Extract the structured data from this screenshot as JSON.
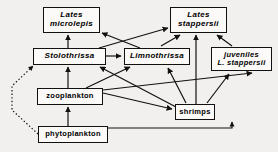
{
  "figure": {
    "type": "food-web-diagram",
    "width": 278,
    "height": 152,
    "background_color": "#f2f0ee",
    "box_fill_color": "#fbfaf8",
    "line_color": "#111111"
  },
  "nodes": [
    {
      "id": "lates-microlepis",
      "label_lines": [
        "Lates",
        "microlepis"
      ],
      "line1": "Lates",
      "line2": "microlepis",
      "style": "italic",
      "x": 43,
      "y": 7,
      "w": 57,
      "h": 26,
      "font_size": 8
    },
    {
      "id": "lates-stappersii",
      "label_lines": [
        "Lates",
        "stappersii"
      ],
      "line1": "Lates",
      "line2": "stappersii",
      "style": "italic",
      "x": 170,
      "y": 7,
      "w": 57,
      "h": 26,
      "font_size": 8
    },
    {
      "id": "stolothrissa",
      "label_lines": [
        "Stolothrissa"
      ],
      "line1": "Stolothrissa",
      "line2": "",
      "style": "italic",
      "x": 33,
      "y": 48,
      "w": 73,
      "h": 17,
      "font_size": 8
    },
    {
      "id": "limnothrissa",
      "label_lines": [
        "Limnothrissa"
      ],
      "line1": "Limnothrissa",
      "line2": "",
      "style": "italic",
      "x": 124,
      "y": 48,
      "w": 66,
      "h": 17,
      "font_size": 8
    },
    {
      "id": "juveniles-l-stappersii",
      "label_lines": [
        "juveniles",
        "L. stappersii"
      ],
      "line1": "juveniles",
      "line2": "L. stappersii",
      "style": "italic",
      "x": 211,
      "y": 47,
      "w": 61,
      "h": 24,
      "font_size": 7.5
    },
    {
      "id": "zooplankton",
      "label_lines": [
        "zooplankton"
      ],
      "line1": "zooplankton",
      "line2": "",
      "style": "plain",
      "x": 37,
      "y": 88,
      "w": 66,
      "h": 17,
      "font_size": 7.5
    },
    {
      "id": "shrimps",
      "label_lines": [
        "shrimps"
      ],
      "line1": "shrimps",
      "line2": "",
      "style": "plain",
      "x": 175,
      "y": 104,
      "w": 40,
      "h": 16,
      "font_size": 7.5
    },
    {
      "id": "phytoplankton",
      "label_lines": [
        "phytoplankton"
      ],
      "line1": "phytoplankton",
      "line2": "",
      "style": "plain",
      "x": 38,
      "y": 126,
      "w": 70,
      "h": 17,
      "font_size": 7.5
    }
  ],
  "edges": [
    {
      "id": "zooplankton-to-stolothrissa",
      "from": "zooplankton",
      "to": "stolothrissa",
      "style": "solid"
    },
    {
      "id": "stolothrissa-to-lates-microlepis",
      "from": "stolothrissa",
      "to": "lates-microlepis",
      "style": "solid"
    },
    {
      "id": "stolothrissa-to-limnothrissa",
      "from": "stolothrissa",
      "to": "limnothrissa",
      "style": "solid"
    },
    {
      "id": "stolothrissa-to-lates-stappersii",
      "from": "stolothrissa",
      "to": "lates-stappersii",
      "style": "solid"
    },
    {
      "id": "limnothrissa-to-lates-microlepis",
      "from": "limnothrissa",
      "to": "lates-microlepis",
      "style": "solid"
    },
    {
      "id": "limnothrissa-to-lates-stappersii",
      "from": "limnothrissa",
      "to": "lates-stappersii",
      "style": "solid"
    },
    {
      "id": "juveniles-to-lates-stappersii",
      "from": "juveniles-l-stappersii",
      "to": "lates-stappersii",
      "style": "solid"
    },
    {
      "id": "shrimps-to-lates-stappersii",
      "from": "shrimps",
      "to": "lates-stappersii",
      "style": "solid"
    },
    {
      "id": "shrimps-to-juveniles",
      "from": "shrimps",
      "to": "juveniles-l-stappersii",
      "style": "solid"
    },
    {
      "id": "shrimps-to-limnothrissa",
      "from": "shrimps",
      "to": "limnothrissa",
      "style": "solid"
    },
    {
      "id": "shrimps-to-stolothrissa",
      "from": "shrimps",
      "to": "stolothrissa",
      "style": "solid"
    },
    {
      "id": "zooplankton-to-shrimps",
      "from": "zooplankton",
      "to": "shrimps",
      "style": "solid"
    },
    {
      "id": "zooplankton-to-limnothrissa",
      "from": "zooplankton",
      "to": "limnothrissa",
      "style": "solid"
    },
    {
      "id": "zooplankton-to-juveniles",
      "from": "zooplankton",
      "to": "juveniles-l-stappersii",
      "style": "solid"
    },
    {
      "id": "phytoplankton-to-zooplankton",
      "from": "phytoplankton",
      "to": "zooplankton",
      "style": "solid"
    },
    {
      "id": "phytoplankton-to-shrimps",
      "from": "phytoplankton",
      "to": "shrimps",
      "style": "solid"
    },
    {
      "id": "phytoplankton-to-stolothrissa-dotted",
      "from": "phytoplankton",
      "to": "stolothrissa",
      "style": "dotted"
    }
  ]
}
